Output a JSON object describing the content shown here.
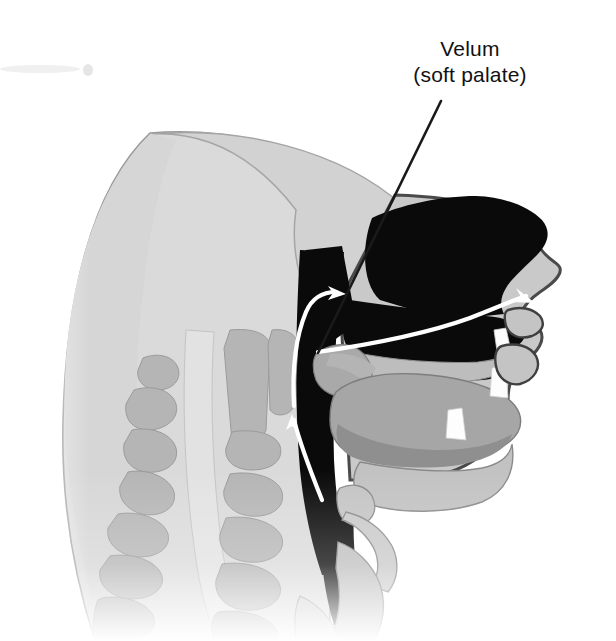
{
  "figure": {
    "width": 616,
    "height": 641,
    "background_color": "#ffffff"
  },
  "callouts": [
    {
      "name": "velum",
      "line1": "Velum",
      "line2": "(soft palate)",
      "text_color": "#111111",
      "leader_line_color": "#1a1a1a",
      "leader_from": [
        441,
        101
      ],
      "leader_to": [
        318,
        353
      ],
      "points_at": "velum-soft-palate"
    }
  ],
  "anatomy": {
    "regions": [
      {
        "name": "cranium-skull",
        "label": "Cranium",
        "color": "#d2d2d2"
      },
      {
        "name": "facial-soft-tissue",
        "label": "Facial soft tissue",
        "color": "#c9c9c9"
      },
      {
        "name": "nasal-cavity",
        "label": "Nasal cavity",
        "color": "#0a0a0a"
      },
      {
        "name": "oral-cavity",
        "label": "Oral cavity",
        "color": "#0a0a0a"
      },
      {
        "name": "pharynx-airway",
        "label": "Pharynx",
        "color": "#0a0a0a"
      },
      {
        "name": "velum-soft-palate",
        "label": "Velum (soft palate)",
        "color": "#a9a9a9"
      },
      {
        "name": "hard-palate",
        "label": "Hard palate",
        "color": "#bdbdbd"
      },
      {
        "name": "tongue",
        "label": "Tongue",
        "color": "#a6a6a6"
      },
      {
        "name": "tongue-root",
        "label": "Tongue root",
        "color": "#909090"
      },
      {
        "name": "mandible-jaw",
        "label": "Mandible",
        "color": "#c2c2c2"
      },
      {
        "name": "upper-teeth",
        "label": "Upper incisors",
        "color": "#fdfdfd"
      },
      {
        "name": "lower-teeth",
        "label": "Lower incisors",
        "color": "#fdfdfd"
      },
      {
        "name": "upper-lip",
        "label": "Upper lip",
        "color": "#c9c9c9"
      },
      {
        "name": "lower-lip",
        "label": "Lower lip",
        "color": "#c9c9c9"
      },
      {
        "name": "epiglottis",
        "label": "Epiglottis",
        "color": "#c4c4c4"
      },
      {
        "name": "hyoid-bone",
        "label": "Hyoid bone",
        "color": "#c4c4c4"
      },
      {
        "name": "larynx",
        "label": "Larynx",
        "color": "#bfbfbf"
      },
      {
        "name": "trachea",
        "label": "Trachea",
        "color": "#cfcfcf"
      },
      {
        "name": "cervical-vertebrae",
        "label": "Cervical vertebrae",
        "color": "#b5b5b5"
      },
      {
        "name": "spinal-column-channel",
        "label": "Spinal canal",
        "color": "#dcdcdc"
      },
      {
        "name": "neck-soft-tissue",
        "label": "Neck soft tissue",
        "color": "#dadada"
      }
    ],
    "vertebrae_count": 7
  },
  "airflow": {
    "stroke_color": "#ffffff",
    "arrows": [
      {
        "name": "pharyngeal-upward-arrow",
        "label": "Airflow rising through pharynx",
        "direction": "up",
        "tip": [
          292,
          414
        ]
      },
      {
        "name": "velar-forward-arrow",
        "label": "Airflow past velum into oral cavity",
        "direction": "right",
        "tip": [
          346,
          294
        ]
      },
      {
        "name": "oral-outward-arrow",
        "label": "Airflow exiting through lips",
        "direction": "right-down",
        "tip": [
          535,
          303
        ]
      }
    ]
  },
  "artifacts": [
    {
      "name": "scan-smudge-top-left",
      "color": "#f2f2f2"
    }
  ]
}
